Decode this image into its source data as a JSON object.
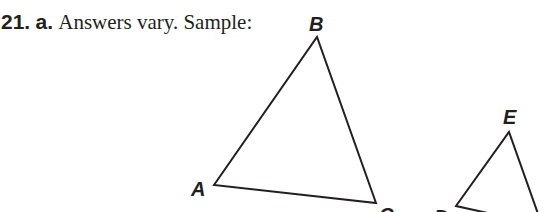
{
  "problem": {
    "number": "21.",
    "part": "a.",
    "text": "Answers vary. Sample:"
  },
  "figure": {
    "stroke_color": "#231f20",
    "triangle_1": {
      "vertices": {
        "A": {
          "label": "A",
          "x": 214,
          "y": 185
        },
        "B": {
          "label": "B",
          "x": 317,
          "y": 37
        },
        "C": {
          "label": "C",
          "x": 376,
          "y": 203
        }
      }
    },
    "triangle_2": {
      "vertices": {
        "D": {
          "label": "D",
          "x": 456,
          "y": 206
        },
        "E": {
          "label": "E",
          "x": 509,
          "y": 132
        },
        "F": {
          "label": "F",
          "x": 542,
          "y": 225
        }
      }
    }
  }
}
